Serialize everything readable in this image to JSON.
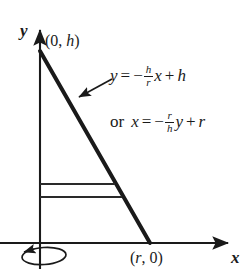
{
  "figure": {
    "axes": {
      "x_label": "x",
      "y_label": "y"
    },
    "points": [
      {
        "x": "0",
        "y": "h"
      },
      {
        "x": "r",
        "y": "0"
      }
    ],
    "equations": [
      {
        "prefix": "",
        "lhs": "y",
        "equals": "=",
        "sign": "−",
        "fraction": {
          "numerator": "h",
          "denominator": "r"
        },
        "variable": "x",
        "operator": "+",
        "constant": "h"
      },
      {
        "prefix": "or",
        "lhs": "x",
        "equals": "=",
        "sign": "−",
        "fraction": {
          "numerator": "r",
          "denominator": "h"
        },
        "variable": "y",
        "operator": "+",
        "constant": "r"
      }
    ],
    "colors": {
      "ink": "#1a1a1a",
      "background": "#ffffff"
    }
  }
}
